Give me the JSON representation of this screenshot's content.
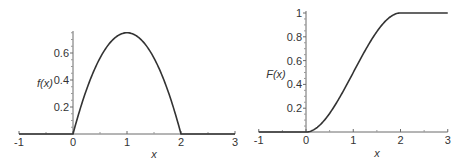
{
  "chart_data": [
    {
      "type": "line",
      "title": "",
      "xlabel": "x",
      "ylabel": "f(x)",
      "xlim": [
        -1,
        3
      ],
      "ylim": [
        0,
        0.75
      ],
      "x_ticks": [
        -1,
        0,
        1,
        2,
        3
      ],
      "x_tick_labels": [
        "-1",
        "0",
        "1",
        "2",
        "3"
      ],
      "y_ticks": [
        0.2,
        0.4,
        0.6
      ],
      "y_tick_labels": [
        "0.2",
        "0.4",
        "0.6"
      ],
      "grid": false,
      "legend": "none",
      "series": [
        {
          "name": "f(x)",
          "formula": "0.75*x*(2-x) for 0<=x<=2, else 0",
          "x": [
            -1,
            0,
            0.25,
            0.5,
            0.75,
            1,
            1.25,
            1.5,
            1.75,
            2,
            3
          ],
          "y": [
            0,
            0,
            0.328,
            0.5625,
            0.703,
            0.75,
            0.703,
            0.5625,
            0.328,
            0,
            0
          ]
        }
      ]
    },
    {
      "type": "line",
      "title": "",
      "xlabel": "x",
      "ylabel": "F(x)",
      "xlim": [
        -1,
        3
      ],
      "ylim": [
        0,
        1
      ],
      "x_ticks": [
        -1,
        0,
        1,
        2,
        3
      ],
      "x_tick_labels": [
        "-1",
        "0",
        "1",
        "2",
        "3"
      ],
      "y_ticks": [
        0.2,
        0.4,
        0.6,
        0.8,
        1
      ],
      "y_tick_labels": [
        "0.2",
        "0.4",
        "0.6",
        "0.8",
        "1"
      ],
      "grid": false,
      "legend": "none",
      "series": [
        {
          "name": "F(x)",
          "formula": "0 for x<0; 0.75*x^2 - 0.25*x^3 for 0<=x<=2; 1 for x>2",
          "x": [
            -1,
            0,
            0.25,
            0.5,
            0.75,
            1,
            1.25,
            1.5,
            1.75,
            2,
            3
          ],
          "y": [
            0,
            0,
            0.043,
            0.156,
            0.316,
            0.5,
            0.684,
            0.844,
            0.957,
            1,
            1
          ]
        }
      ]
    }
  ]
}
